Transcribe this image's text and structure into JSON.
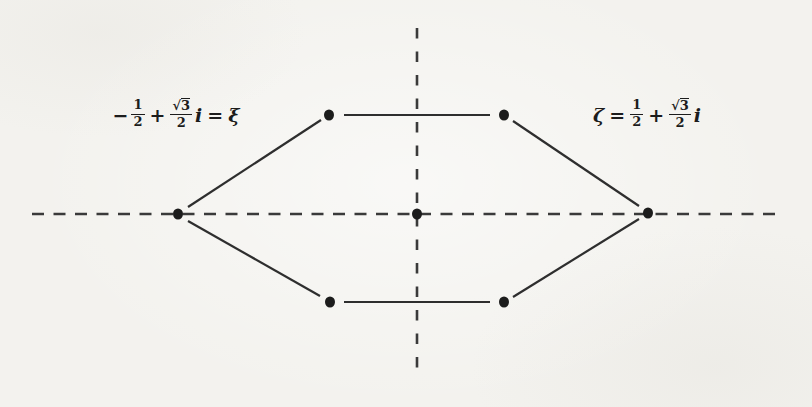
{
  "figure": {
    "colors": {
      "paper_background": "#f3f2ee",
      "ink": "#1c1c1c",
      "dashed_axis": "#3a3a3a",
      "solid_edge": "#2e2e2e"
    },
    "left_label": {
      "minus": "−",
      "half_num": "1",
      "half_den": "2",
      "plus": "+",
      "radical": "√",
      "radicand": "3",
      "sqrt_den": "2",
      "imag_unit": "i",
      "equals": "=",
      "root_symbol": "ξ"
    },
    "right_label": {
      "root_symbol": "ζ",
      "equals": "=",
      "half_num": "1",
      "half_den": "2",
      "plus": "+",
      "radical": "√",
      "radicand": "3",
      "sqrt_den": "2",
      "imag_unit": "i"
    },
    "dots": [
      {
        "name": "left-vertex",
        "x": 178,
        "y": 214
      },
      {
        "name": "upper-left-vertex",
        "x": 329,
        "y": 115
      },
      {
        "name": "upper-right-vertex",
        "x": 504,
        "y": 115
      },
      {
        "name": "right-vertex",
        "x": 648,
        "y": 213
      },
      {
        "name": "lower-right-vertex",
        "x": 504,
        "y": 302
      },
      {
        "name": "lower-left-vertex",
        "x": 330,
        "y": 302
      },
      {
        "name": "origin",
        "x": 417,
        "y": 214
      }
    ],
    "axes": {
      "real_axis": {
        "style": "dashed",
        "y": 214,
        "x_start": 32,
        "x_end": 783
      },
      "imaginary_axis": {
        "style": "dashed",
        "x": 417,
        "y_start": 28,
        "y_end": 375
      }
    }
  }
}
